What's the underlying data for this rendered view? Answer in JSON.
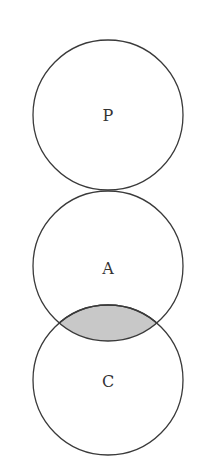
{
  "diagram": {
    "type": "venn",
    "circles": [
      {
        "id": "P",
        "label": "P",
        "cx": 108,
        "cy": 115,
        "r": 75
      },
      {
        "id": "A",
        "label": "A",
        "cx": 108,
        "cy": 266,
        "r": 75
      },
      {
        "id": "C",
        "label": "C",
        "cx": 108,
        "cy": 380,
        "r": 75
      }
    ],
    "shaded_region": {
      "intersection": [
        "A",
        "C"
      ],
      "fill": "#c8c8c8"
    },
    "relations": [
      {
        "between": [
          "P",
          "A"
        ],
        "type": "tangent"
      },
      {
        "between": [
          "A",
          "C"
        ],
        "type": "overlap-shaded"
      }
    ]
  }
}
